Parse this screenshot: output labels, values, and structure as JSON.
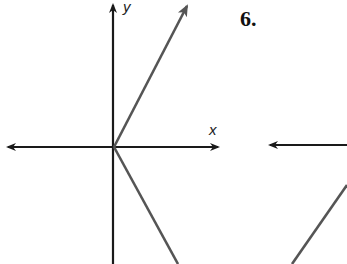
{
  "diagram": {
    "left_graph": {
      "x_label": "x",
      "y_label": "y",
      "description": "Absolute-value style graph: two rays from the origin, one up-right with arrowhead, one down-right"
    },
    "right_graph": {
      "problem_number": "6."
    }
  },
  "colors": {
    "axis": "#1a1a1a",
    "ray": "#555555",
    "background": "#ffffff"
  }
}
